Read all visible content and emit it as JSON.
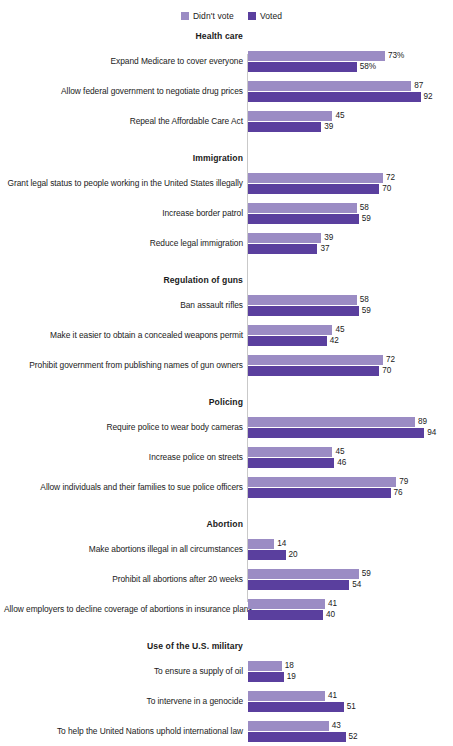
{
  "legend": {
    "position": "top-center",
    "entries": [
      {
        "label": "Didn't vote",
        "color": "#9b8cc4",
        "swatch_name": "legend-swatch-didnt-vote"
      },
      {
        "label": "Voted",
        "color": "#5a3f9e",
        "swatch_name": "legend-swatch-voted"
      }
    ]
  },
  "chart_data": {
    "type": "bar",
    "orientation": "horizontal",
    "title": "",
    "subtitle": "",
    "xlabel": "",
    "ylabel": "",
    "xlim": [
      0,
      100
    ],
    "grid": false,
    "legend_position": "top-center",
    "value_suffix_first_row": "%",
    "series": [
      {
        "name": "Didn't vote",
        "color": "#9b8cc4"
      },
      {
        "name": "Voted",
        "color": "#5a3f9e"
      }
    ],
    "sections": [
      {
        "header": "Health care",
        "items": [
          {
            "label": "Expand Medicare to cover everyone",
            "didnt_vote": 73,
            "voted": 58,
            "didnt_vote_display": "73%",
            "voted_display": "58%"
          },
          {
            "label": "Allow federal government to negotiate drug prices",
            "didnt_vote": 87,
            "voted": 92,
            "didnt_vote_display": "87",
            "voted_display": "92"
          },
          {
            "label": "Repeal the Affordable Care Act",
            "didnt_vote": 45,
            "voted": 39,
            "didnt_vote_display": "45",
            "voted_display": "39"
          }
        ]
      },
      {
        "header": "Immigration",
        "items": [
          {
            "label": "Grant legal status to people working in the United States illegally",
            "didnt_vote": 72,
            "voted": 70,
            "didnt_vote_display": "72",
            "voted_display": "70"
          },
          {
            "label": "Increase border patrol",
            "didnt_vote": 58,
            "voted": 59,
            "didnt_vote_display": "58",
            "voted_display": "59"
          },
          {
            "label": "Reduce legal immigration",
            "didnt_vote": 39,
            "voted": 37,
            "didnt_vote_display": "39",
            "voted_display": "37"
          }
        ]
      },
      {
        "header": "Regulation of guns",
        "items": [
          {
            "label": "Ban assault rifles",
            "didnt_vote": 58,
            "voted": 59,
            "didnt_vote_display": "58",
            "voted_display": "59"
          },
          {
            "label": "Make it easier to obtain a concealed weapons permit",
            "didnt_vote": 45,
            "voted": 42,
            "didnt_vote_display": "45",
            "voted_display": "42"
          },
          {
            "label": "Prohibit government from publishing names of gun owners",
            "didnt_vote": 72,
            "voted": 70,
            "didnt_vote_display": "72",
            "voted_display": "70"
          }
        ]
      },
      {
        "header": "Policing",
        "items": [
          {
            "label": "Require police to wear body cameras",
            "didnt_vote": 89,
            "voted": 94,
            "didnt_vote_display": "89",
            "voted_display": "94"
          },
          {
            "label": "Increase police on streets",
            "didnt_vote": 45,
            "voted": 46,
            "didnt_vote_display": "45",
            "voted_display": "46"
          },
          {
            "label": "Allow individuals and their families to sue police officers",
            "didnt_vote": 79,
            "voted": 76,
            "didnt_vote_display": "79",
            "voted_display": "76"
          }
        ]
      },
      {
        "header": "Abortion",
        "items": [
          {
            "label": "Make abortions illegal in all circumstances",
            "didnt_vote": 14,
            "voted": 20,
            "didnt_vote_display": "14",
            "voted_display": "20"
          },
          {
            "label": "Prohibit all abortions after 20 weeks",
            "didnt_vote": 59,
            "voted": 54,
            "didnt_vote_display": "59",
            "voted_display": "54"
          },
          {
            "label": "Allow employers to decline coverage of abortions in insurance plans",
            "didnt_vote": 41,
            "voted": 40,
            "didnt_vote_display": "41",
            "voted_display": "40"
          }
        ]
      },
      {
        "header": "Use of the U.S. military",
        "items": [
          {
            "label": "To ensure a supply of oil",
            "didnt_vote": 18,
            "voted": 19,
            "didnt_vote_display": "18",
            "voted_display": "19"
          },
          {
            "label": "To intervene in a genocide",
            "didnt_vote": 41,
            "voted": 51,
            "didnt_vote_display": "41",
            "voted_display": "51"
          },
          {
            "label": "To help the United Nations uphold international law",
            "didnt_vote": 43,
            "voted": 52,
            "didnt_vote_display": "43",
            "voted_display": "52"
          }
        ]
      }
    ]
  }
}
